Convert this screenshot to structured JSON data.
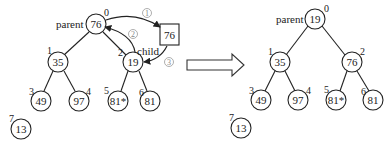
{
  "diagram": {
    "type": "heap-sift-down",
    "before": {
      "labels": {
        "parent": "parent",
        "child": "child"
      },
      "nodes": [
        {
          "index": "0",
          "value": "76"
        },
        {
          "index": "1",
          "value": "35"
        },
        {
          "index": "2",
          "value": "19"
        },
        {
          "index": "3",
          "value": "49"
        },
        {
          "index": "4",
          "value": "97"
        },
        {
          "index": "5",
          "value": "81*"
        },
        {
          "index": "6",
          "value": "81"
        },
        {
          "index": "7",
          "value": "13"
        }
      ],
      "temp_box": {
        "value": "76"
      },
      "steps": [
        {
          "label": "①",
          "description": "copy root to temp"
        },
        {
          "label": "②",
          "description": "move child up to parent"
        },
        {
          "label": "③",
          "description": "temp into child position"
        }
      ]
    },
    "transition_arrow": "right-arrow",
    "after": {
      "labels": {
        "parent": "parent"
      },
      "nodes": [
        {
          "index": "0",
          "value": "19"
        },
        {
          "index": "1",
          "value": "35"
        },
        {
          "index": "2",
          "value": "76"
        },
        {
          "index": "3",
          "value": "49"
        },
        {
          "index": "4",
          "value": "97"
        },
        {
          "index": "5",
          "value": "81*"
        },
        {
          "index": "6",
          "value": "81"
        },
        {
          "index": "7",
          "value": "13"
        }
      ]
    }
  }
}
